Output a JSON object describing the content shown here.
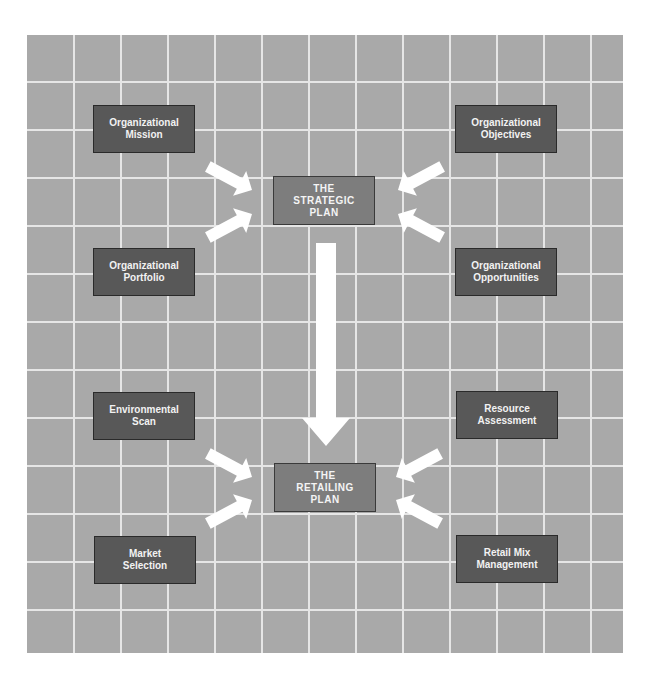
{
  "diagram": {
    "background_color": "#a9a9a9",
    "grid_color": "#e6e6e6",
    "input_box_color": "#585858",
    "plan_box_color": "#7d7d7d",
    "arrow_color": "#ffffff",
    "strategic_inputs": [
      {
        "line1": "Organizational",
        "line2": "Mission"
      },
      {
        "line1": "Organizational",
        "line2": "Portfolio"
      },
      {
        "line1": "Organizational",
        "line2": "Objectives"
      },
      {
        "line1": "Organizational",
        "line2": "Opportunities"
      }
    ],
    "strategic_plan": {
      "line1": "THE",
      "line2": "STRATEGIC",
      "line3": "PLAN"
    },
    "retailing_inputs": [
      {
        "line1": "Environmental",
        "line2": "Scan"
      },
      {
        "line1": "Market",
        "line2": "Selection"
      },
      {
        "line1": "Resource",
        "line2": "Assessment"
      },
      {
        "line1": "Retail Mix",
        "line2": "Management"
      }
    ],
    "retailing_plan": {
      "line1": "THE",
      "line2": "RETAILING",
      "line3": "PLAN"
    }
  }
}
